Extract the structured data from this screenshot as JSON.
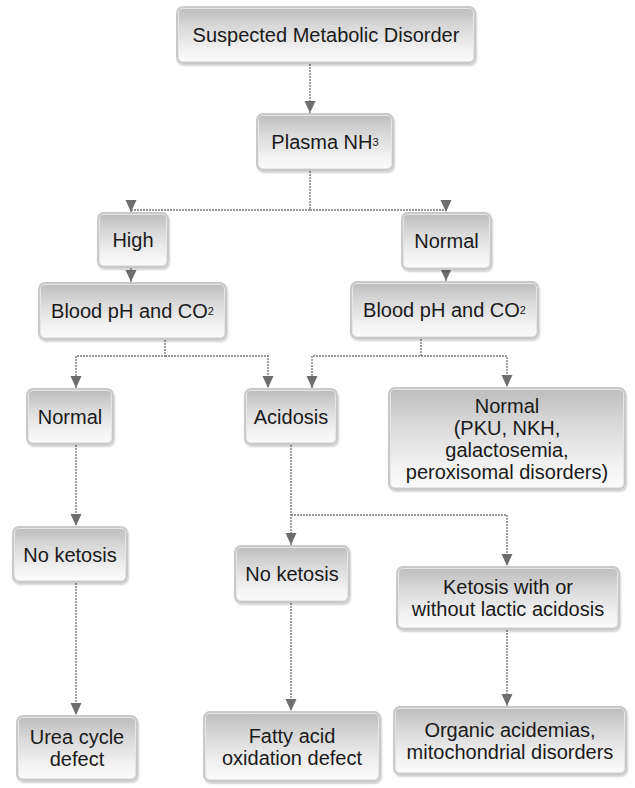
{
  "diagram": {
    "colors": {
      "line": "#7a7a7a",
      "arrow": "#6e6e6e",
      "box_border": "#c9c9c9",
      "text": "#1a1a1a"
    },
    "nodes": {
      "start": {
        "label": "Suspected Metabolic Disorder",
        "x": 176,
        "y": 6,
        "w": 300,
        "h": 58
      },
      "plasma": {
        "label": "Plasma NH",
        "sub": "3",
        "x": 256,
        "y": 113,
        "w": 138,
        "h": 58
      },
      "high": {
        "label": "High",
        "x": 97,
        "y": 212,
        "w": 72,
        "h": 56
      },
      "normal_nh3": {
        "label": "Normal",
        "x": 401,
        "y": 212,
        "w": 91,
        "h": 58
      },
      "bph_left": {
        "label": "Blood pH and CO",
        "sub": "2",
        "x": 38,
        "y": 282,
        "w": 189,
        "h": 58
      },
      "bph_right": {
        "label": "Blood pH and CO",
        "sub": "2",
        "x": 350,
        "y": 281,
        "w": 189,
        "h": 58
      },
      "normal_left": {
        "label": "Normal",
        "x": 26,
        "y": 388,
        "w": 88,
        "h": 57
      },
      "acidosis": {
        "label": "Acidosis",
        "x": 244,
        "y": 388,
        "w": 94,
        "h": 57
      },
      "normal_right": {
        "label": "Normal\n(PKU, NKH,\ngalactosemia,\nperoxisomal disorders)",
        "x": 388,
        "y": 387,
        "w": 238,
        "h": 103
      },
      "noketo_left": {
        "label": "No ketosis",
        "x": 12,
        "y": 526,
        "w": 116,
        "h": 57
      },
      "noketo_mid": {
        "label": "No ketosis",
        "x": 234,
        "y": 545,
        "w": 116,
        "h": 58
      },
      "ketosis": {
        "label": "Ketosis with or\nwithout lactic acidosis",
        "x": 396,
        "y": 566,
        "w": 224,
        "h": 64
      },
      "urea": {
        "label": "Urea cycle\ndefect",
        "x": 16,
        "y": 715,
        "w": 122,
        "h": 66
      },
      "fatty": {
        "label": "Fatty acid\noxidation defect",
        "x": 203,
        "y": 711,
        "w": 178,
        "h": 71
      },
      "organic": {
        "label": "Organic acidemias,\nmitochondrial disorders",
        "x": 393,
        "y": 706,
        "w": 234,
        "h": 69
      }
    },
    "edges": [
      {
        "from": "start",
        "to": "plasma",
        "points": [
          [
            310,
            64
          ],
          [
            310,
            113
          ]
        ]
      },
      {
        "from": "plasma",
        "to": "high",
        "points": [
          [
            310,
            171
          ],
          [
            310,
            210
          ],
          [
            131,
            210
          ],
          [
            131,
            212
          ]
        ]
      },
      {
        "from": "plasma",
        "to": "normal_nh3",
        "points": [
          [
            310,
            210
          ],
          [
            446,
            210
          ],
          [
            446,
            212
          ]
        ]
      },
      {
        "from": "high",
        "to": "bph_left",
        "points": [
          [
            131,
            268
          ],
          [
            131,
            282
          ]
        ]
      },
      {
        "from": "normal_nh3",
        "to": "bph_right",
        "points": [
          [
            446,
            270
          ],
          [
            446,
            281
          ]
        ]
      },
      {
        "from": "bph_left",
        "to": "normal_left",
        "points": [
          [
            165,
            340
          ],
          [
            165,
            356
          ],
          [
            76,
            356
          ],
          [
            76,
            388
          ]
        ]
      },
      {
        "from": "bph_left",
        "to": "acidosis",
        "points": [
          [
            165,
            356
          ],
          [
            268,
            356
          ],
          [
            268,
            388
          ]
        ]
      },
      {
        "from": "bph_right",
        "to": "acidosis",
        "points": [
          [
            421,
            339
          ],
          [
            421,
            356
          ],
          [
            312,
            356
          ],
          [
            312,
            388
          ]
        ]
      },
      {
        "from": "bph_right",
        "to": "normal_right",
        "points": [
          [
            421,
            356
          ],
          [
            507,
            356
          ],
          [
            507,
            387
          ]
        ]
      },
      {
        "from": "normal_left",
        "to": "noketo_left",
        "points": [
          [
            76,
            445
          ],
          [
            76,
            526
          ]
        ]
      },
      {
        "from": "acidosis",
        "to": "noketo_mid",
        "points": [
          [
            291,
            445
          ],
          [
            291,
            545
          ]
        ]
      },
      {
        "from": "acidosis",
        "to": "ketosis",
        "points": [
          [
            291,
            515
          ],
          [
            507,
            515
          ],
          [
            507,
            566
          ]
        ]
      },
      {
        "from": "noketo_left",
        "to": "urea",
        "points": [
          [
            76,
            583
          ],
          [
            76,
            715
          ]
        ]
      },
      {
        "from": "noketo_mid",
        "to": "fatty",
        "points": [
          [
            291,
            603
          ],
          [
            291,
            711
          ]
        ]
      },
      {
        "from": "ketosis",
        "to": "organic",
        "points": [
          [
            507,
            630
          ],
          [
            507,
            706
          ]
        ]
      }
    ]
  }
}
